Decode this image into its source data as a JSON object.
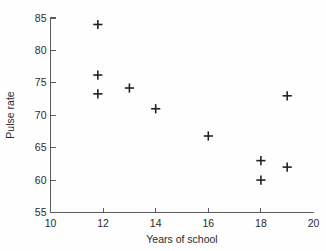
{
  "chart_data": {
    "type": "scatter",
    "title": "",
    "xlabel": "Years of school",
    "ylabel": "Pulse rate",
    "xlim": [
      10,
      20
    ],
    "ylim": [
      55,
      85
    ],
    "xticks": [
      10,
      12,
      14,
      16,
      18,
      20
    ],
    "yticks": [
      55,
      60,
      65,
      70,
      75,
      80,
      85
    ],
    "xtick_labels": [
      "10",
      "12",
      "14",
      "16",
      "18",
      "20"
    ],
    "ytick_labels": [
      "55",
      "60",
      "65",
      "70",
      "75",
      "80",
      "85"
    ],
    "grid": false,
    "legend": null,
    "marker": "plus",
    "marker_color": "#222222",
    "points": [
      {
        "x": 11.8,
        "y": 84.0
      },
      {
        "x": 11.8,
        "y": 76.2
      },
      {
        "x": 11.8,
        "y": 73.3
      },
      {
        "x": 13.0,
        "y": 74.2
      },
      {
        "x": 14.0,
        "y": 71.0
      },
      {
        "x": 16.0,
        "y": 66.8
      },
      {
        "x": 18.0,
        "y": 63.0
      },
      {
        "x": 18.0,
        "y": 60.0
      },
      {
        "x": 19.0,
        "y": 73.0
      },
      {
        "x": 19.0,
        "y": 62.0
      }
    ],
    "series": [
      {
        "name": "observations",
        "x": [
          11.8,
          11.8,
          11.8,
          13.0,
          14.0,
          16.0,
          18.0,
          18.0,
          19.0,
          19.0
        ],
        "values": [
          84.0,
          76.2,
          73.3,
          74.2,
          71.0,
          66.8,
          63.0,
          60.0,
          73.0,
          62.0
        ]
      }
    ]
  },
  "figure": {
    "background_color": "#fefefe",
    "axis_color": "#5a5a5a",
    "text_color": "#2b2b2b"
  }
}
